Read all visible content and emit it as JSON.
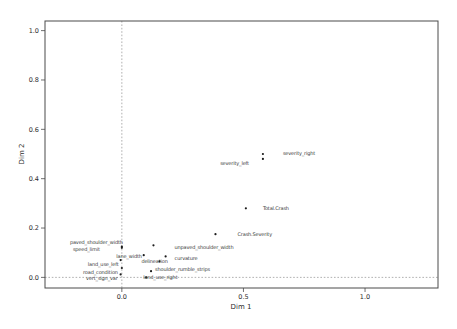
{
  "chart_data": {
    "type": "scatter",
    "title": "",
    "xlabel": "Dim 1",
    "ylabel": "Dim 2",
    "xlim": [
      -0.316,
      1.3
    ],
    "ylim": [
      -0.043,
      1.039
    ],
    "x_ticks": [
      "0.0",
      "0.5",
      "1.0"
    ],
    "x_tick_values": [
      0.0,
      0.5,
      1.0
    ],
    "y_ticks": [
      "0.0",
      "0.2",
      "0.4",
      "0.6",
      "0.8",
      "1.0"
    ],
    "y_tick_values": [
      0.0,
      0.2,
      0.4,
      0.6,
      0.8,
      1.0
    ],
    "grid": false,
    "legend": null,
    "reference_lines": {
      "vertical_at_x": 0.0,
      "horizontal_at_y": 0.0,
      "style": "dashed"
    },
    "colors": {
      "background": "#ffffff",
      "frame": "#4a4a4a",
      "point": "#1c1c1c",
      "label": "#3a3a3a",
      "dashed_line": "#7a7a7a",
      "tick": "#4a4a4a"
    },
    "points": [
      {
        "label": "severity_right",
        "x": 0.58,
        "y": 0.5,
        "anchor": "start",
        "dx": 20,
        "dy": 1
      },
      {
        "label": "severity_left",
        "x": 0.58,
        "y": 0.48,
        "anchor": "end",
        "dx": -14,
        "dy": 6
      },
      {
        "label": "Total.Crash",
        "x": 0.51,
        "y": 0.28,
        "anchor": "start",
        "dx": 17,
        "dy": 2
      },
      {
        "label": "Crash.Severity",
        "x": 0.385,
        "y": 0.175,
        "anchor": "start",
        "dx": 22,
        "dy": 2
      },
      {
        "label": "unpaved_shoulder_width",
        "x": 0.13,
        "y": 0.13,
        "anchor": "start",
        "dx": 21,
        "dy": 4
      },
      {
        "label": "paved_shoulder_width",
        "x": 0.0,
        "y": 0.125,
        "anchor": "end",
        "dx": 1,
        "dy": -3
      },
      {
        "label": "speed_limit",
        "x": 0.0,
        "y": 0.12,
        "anchor": "end",
        "dx": -22,
        "dy": 3
      },
      {
        "label": "lane_width",
        "x": 0.09,
        "y": 0.09,
        "anchor": "end",
        "dx": -2,
        "dy": 3
      },
      {
        "label": "curvature",
        "x": 0.18,
        "y": 0.085,
        "anchor": "start",
        "dx": 9,
        "dy": 4
      },
      {
        "label": "delineation",
        "x": 0.155,
        "y": 0.065,
        "anchor": "middle",
        "dx": -5,
        "dy": 2
      },
      {
        "label": "land_use_left",
        "x": -0.005,
        "y": 0.07,
        "anchor": "end",
        "dx": -2,
        "dy": 6
      },
      {
        "label": "road_condition",
        "x": 0.0,
        "y": 0.038,
        "anchor": "end",
        "dx": -4,
        "dy": 6
      },
      {
        "label": "vert_sign_var",
        "x": -0.005,
        "y": 0.012,
        "anchor": "end",
        "dx": -3,
        "dy": 6
      },
      {
        "label": "shoulder_rumble_strips",
        "x": 0.12,
        "y": 0.025,
        "anchor": "start",
        "dx": 4,
        "dy": 0
      },
      {
        "label": "land_use_right",
        "x": 0.1,
        "y": 0.0,
        "anchor": "start",
        "dx": -3,
        "dy": 2
      }
    ]
  }
}
